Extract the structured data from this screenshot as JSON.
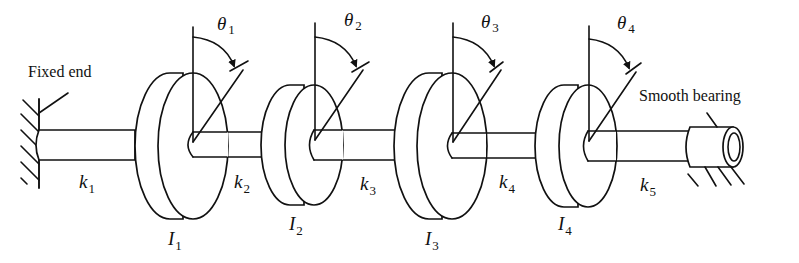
{
  "diagram": {
    "type": "torsional-vibration-system",
    "annotations": {
      "fixed_end": "Fixed end",
      "smooth_bearing": "Smooth bearing"
    },
    "disks": [
      {
        "inertia_symbol": "I",
        "inertia_sub": "1",
        "angle_symbol": "θ",
        "angle_sub": "1"
      },
      {
        "inertia_symbol": "I",
        "inertia_sub": "2",
        "angle_symbol": "θ",
        "angle_sub": "2"
      },
      {
        "inertia_symbol": "I",
        "inertia_sub": "3",
        "angle_symbol": "θ",
        "angle_sub": "3"
      },
      {
        "inertia_symbol": "I",
        "inertia_sub": "4",
        "angle_symbol": "θ",
        "angle_sub": "4"
      }
    ],
    "shafts": [
      {
        "stiffness_symbol": "k",
        "stiffness_sub": "1"
      },
      {
        "stiffness_symbol": "k",
        "stiffness_sub": "2"
      },
      {
        "stiffness_symbol": "k",
        "stiffness_sub": "3"
      },
      {
        "stiffness_symbol": "k",
        "stiffness_sub": "4"
      },
      {
        "stiffness_symbol": "k",
        "stiffness_sub": "5"
      }
    ],
    "colors": {
      "line": "#111111",
      "background": "#ffffff"
    }
  }
}
